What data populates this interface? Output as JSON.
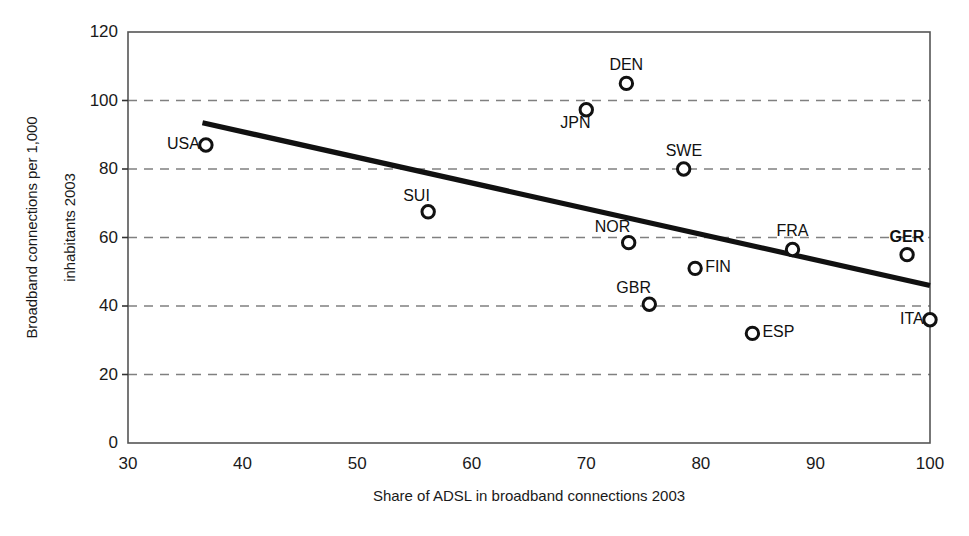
{
  "chart_data": {
    "type": "scatter",
    "title": "",
    "xlabel": "Share of ADSL in broadband connections 2003",
    "ylabel_line1": "Broadband connections per 1,000",
    "ylabel_line2": "inhabitants 2003",
    "xlim": [
      30,
      100
    ],
    "ylim": [
      0,
      120
    ],
    "xticks": [
      30,
      40,
      50,
      60,
      70,
      80,
      90,
      100
    ],
    "yticks": [
      0,
      20,
      40,
      60,
      80,
      100,
      120
    ],
    "grid": "horizontal-dashed",
    "legend": "none",
    "points": [
      {
        "label": "USA",
        "x": 36.8,
        "y": 87,
        "label_pos": "left",
        "bold": false
      },
      {
        "label": "SUI",
        "x": 56.2,
        "y": 67.5,
        "label_pos": "above-left",
        "bold": false
      },
      {
        "label": "JPN",
        "x": 70.0,
        "y": 97.3,
        "label_pos": "below-left",
        "bold": false
      },
      {
        "label": "DEN",
        "x": 73.5,
        "y": 105,
        "label_pos": "above",
        "bold": false
      },
      {
        "label": "NOR",
        "x": 73.7,
        "y": 58.5,
        "label_pos": "above-left",
        "bold": false
      },
      {
        "label": "GBR",
        "x": 75.5,
        "y": 40.5,
        "label_pos": "above-left",
        "bold": false
      },
      {
        "label": "SWE",
        "x": 78.5,
        "y": 80,
        "label_pos": "above",
        "bold": false
      },
      {
        "label": "FIN",
        "x": 79.5,
        "y": 51,
        "label_pos": "right",
        "bold": false
      },
      {
        "label": "ESP",
        "x": 84.5,
        "y": 32,
        "label_pos": "right",
        "bold": false
      },
      {
        "label": "FRA",
        "x": 88.0,
        "y": 56.5,
        "label_pos": "above",
        "bold": false
      },
      {
        "label": "GER",
        "x": 98.0,
        "y": 55,
        "label_pos": "above",
        "bold": true
      },
      {
        "label": "ITA",
        "x": 100.0,
        "y": 36,
        "label_pos": "left",
        "bold": false
      }
    ],
    "trendline": {
      "x0": 36.5,
      "y0": 93.5,
      "x1": 100,
      "y1": 46
    },
    "colors": {
      "marker": "#111111",
      "trendline": "#111111",
      "grid": "#808080",
      "frame": "#555555"
    }
  }
}
